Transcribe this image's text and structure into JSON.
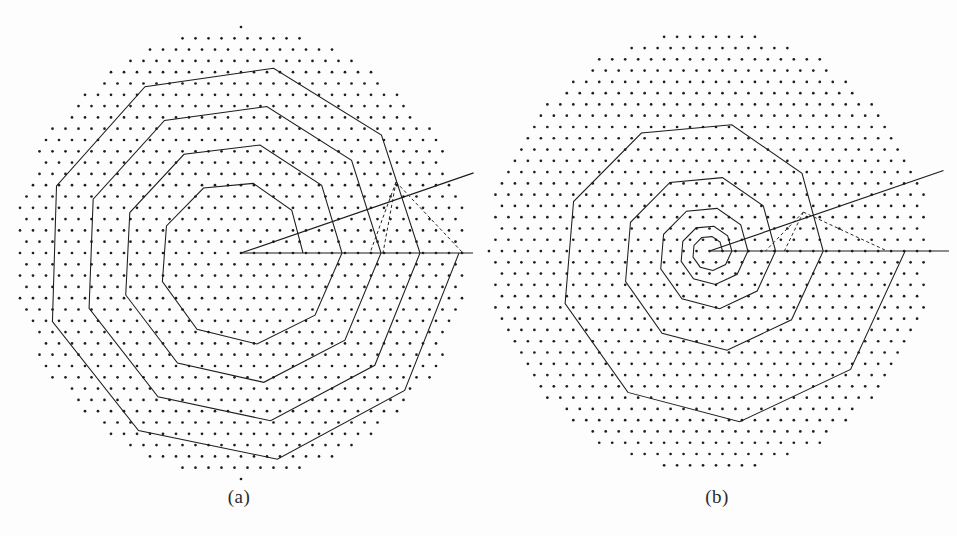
{
  "figure": {
    "kind": "two-panel-spiral-lattice-diagram",
    "background_color": "#fdfdfd",
    "ink_color": "#1c1c1c",
    "dot_color": "#1e1e1e",
    "width": 957,
    "height": 536
  },
  "panels": [
    {
      "id": "a",
      "caption": "(a)",
      "center": {
        "x": 241,
        "y": 253
      },
      "lattice": {
        "spacing_x": 13.0,
        "spacing_y": 11.3,
        "row_offset_x": 6.5,
        "dot_radius": 1.35,
        "field_radius": 226,
        "pattern": "triangular"
      },
      "spiral": {
        "type": "archimedean",
        "sides_per_turn": 9,
        "turns": 4,
        "start_radius": 62,
        "end_radius": 218,
        "start_angle_deg": 0,
        "vertex_count": 37
      },
      "rays": [
        {
          "name": "horizontal-ray",
          "angle_deg": 0,
          "length": 232
        },
        {
          "name": "angled-ray",
          "angle_deg": -19,
          "length": 246
        }
      ],
      "dashed_construction": {
        "apex": {
          "x": 396,
          "y": 182
        },
        "foot_inner": {
          "x": 370,
          "y": 253
        },
        "foot_outer": {
          "x": 463,
          "y": 253
        }
      }
    },
    {
      "id": "b",
      "caption": "(b)",
      "center": {
        "x": 710,
        "y": 251
      },
      "lattice": {
        "spacing_x": 13.0,
        "spacing_y": 11.3,
        "row_offset_x": 6.5,
        "dot_radius": 1.35,
        "field_radius": 222,
        "pattern": "triangular"
      },
      "spiral": {
        "type": "logarithmic",
        "sides_per_turn": 9,
        "turns": 5,
        "start_radius": 13,
        "end_radius": 196,
        "start_angle_deg": 0,
        "growth_ratio_per_turn": 2.05,
        "vertex_count": 46
      },
      "rays": [
        {
          "name": "horizontal-ray",
          "angle_deg": 0,
          "length": 240
        },
        {
          "name": "angled-ray",
          "angle_deg": -19,
          "length": 248
        }
      ],
      "dashed_construction": {
        "apex": {
          "x": 804,
          "y": 212
        },
        "foot_inner": {
          "x": 766,
          "y": 251
        },
        "foot_outer": {
          "x": 888,
          "y": 251
        }
      }
    }
  ]
}
